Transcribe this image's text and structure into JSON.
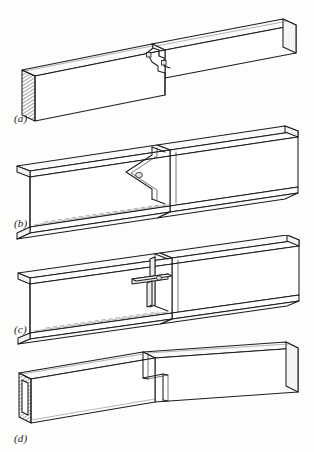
{
  "figure": {
    "background_color": "#fdfdfc",
    "line_color": "#1d1d1d",
    "panel_count": 4
  },
  "panels": [
    {
      "label": "(a)",
      "name": "timber-scarf-splice",
      "member_type": "rectangular timber beam",
      "joint_type": "stepped scarf splice with bolts",
      "end_treatment": "hatched end grain section",
      "fastener_count": 2,
      "fastener_shape": "square"
    },
    {
      "label": "(b)",
      "name": "i-beam-v-notch-splice",
      "member_type": "wide-flange I-beam",
      "joint_type": "chevron / vee web splice with pin",
      "end_treatment": "open I section",
      "fastener_count": 1,
      "fastener_shape": "circle"
    },
    {
      "label": "(c)",
      "name": "i-beam-tee-stub-splice",
      "member_type": "wide-flange I-beam",
      "joint_type": "tee stub web connector splice",
      "end_treatment": "open I section",
      "fastener_count": 1,
      "fastener_shape": "circle"
    },
    {
      "label": "(d)",
      "name": "box-beam-halved-lap",
      "member_type": "hollow rectangular box beam",
      "joint_type": "stepped halved lap joint",
      "end_treatment": "hollow box end",
      "fastener_count": 0,
      "fastener_shape": "none"
    }
  ]
}
